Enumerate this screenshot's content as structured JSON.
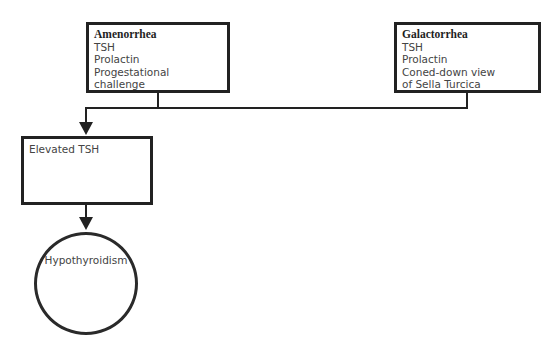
{
  "diagram": {
    "type": "flowchart",
    "nodes": {
      "amenorrhea": {
        "title": "Amenorrhea",
        "lines": [
          "TSH",
          "Prolactin",
          "Progestational challenge"
        ]
      },
      "galactorrhea": {
        "title": "Galactorrhea",
        "lines": [
          "TSH",
          "Prolactin",
          "Coned-down view",
          "of Sella Turcica"
        ]
      },
      "elevated_tsh": {
        "label": "Elevated TSH"
      },
      "hypothyroidism": {
        "label": "Hypothyroidism",
        "shape": "circle"
      }
    },
    "edges": [
      {
        "from": "amenorrhea",
        "to": "elevated_tsh"
      },
      {
        "from": "galactorrhea",
        "to": "elevated_tsh"
      },
      {
        "from": "elevated_tsh",
        "to": "hypothyroidism"
      }
    ],
    "colors": {
      "line": "#222222",
      "text": "#444444",
      "background": "#ffffff"
    }
  }
}
